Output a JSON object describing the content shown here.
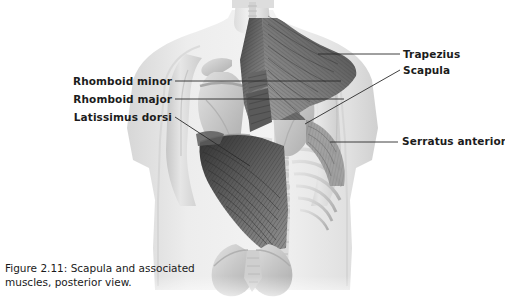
{
  "figure": {
    "caption_line1": "Figure 2.11: Scapula and associated",
    "caption_line2": "muscles, posterior view.",
    "view": "posterior view",
    "illustration_name": "human-upper-back-musculature",
    "palette": {
      "background": "#ffffff",
      "skin_light": "#e9e9e9",
      "skin_mid": "#d6d6d6",
      "bone_light": "#d2d2d2",
      "bone_mid": "#b9b9b9",
      "muscle_dark": "#4a4a4a",
      "muscle_mid": "#7a7a7a",
      "muscle_light": "#a6a6a6",
      "leader_line": "#2b2b2b",
      "label_text": "#1c1c1c",
      "caption_text": "#1a1a1a"
    }
  },
  "labels": {
    "left": [
      {
        "id": "rhomboid-minor",
        "text": "Rhomboid minor"
      },
      {
        "id": "rhomboid-major",
        "text": "Rhomboid major"
      },
      {
        "id": "latissimus-dorsi",
        "text": "Latissimus dorsi"
      }
    ],
    "right": [
      {
        "id": "trapezius",
        "text": "Trapezius"
      },
      {
        "id": "scapula",
        "text": "Scapula"
      },
      {
        "id": "serratus-anterior",
        "text": "Serratus anterior"
      }
    ]
  },
  "leader_lines": [
    {
      "id": "leader-rhomboid-minor",
      "from": [
        175,
        81
      ],
      "to": [
        341,
        81
      ]
    },
    {
      "id": "leader-rhomboid-major",
      "from": [
        175,
        99
      ],
      "to": [
        344,
        99
      ]
    },
    {
      "id": "leader-latissimus-dorsi",
      "from": [
        175,
        117
      ],
      "to": [
        250,
        166
      ]
    },
    {
      "id": "leader-trapezius",
      "from": [
        400,
        54
      ],
      "to": [
        318,
        54
      ]
    },
    {
      "id": "leader-scapula",
      "from": [
        400,
        70
      ],
      "to": [
        305,
        124
      ]
    },
    {
      "id": "leader-serratus-anterior",
      "from": [
        398,
        142
      ],
      "to": [
        330,
        142
      ]
    }
  ]
}
